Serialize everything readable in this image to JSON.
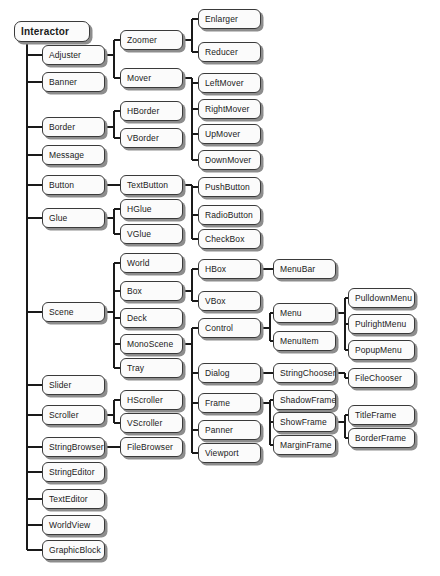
{
  "diagram": {
    "type": "class-hierarchy-tree",
    "orientation": "left-to-right",
    "style": {
      "node_fill": "#fbfbfb",
      "node_border": "#3a3a3a",
      "node_shadow": "#8d8d8d",
      "connector": "#1a1a1a",
      "background": "#ffffff"
    },
    "columns": [
      {
        "index": 1,
        "x": 14,
        "width": 76,
        "nodes": [
          {
            "id": "interactor",
            "label": "Interactor",
            "y": 21,
            "root": true,
            "parent": null
          }
        ]
      },
      {
        "index": 2,
        "x": 42,
        "width": 63,
        "nodes": [
          {
            "id": "adjuster",
            "label": "Adjuster",
            "y": 45,
            "parent": "interactor"
          },
          {
            "id": "banner",
            "label": "Banner",
            "y": 72,
            "parent": "interactor"
          },
          {
            "id": "border",
            "label": "Border",
            "y": 117,
            "parent": "interactor"
          },
          {
            "id": "message",
            "label": "Message",
            "y": 145,
            "parent": "interactor"
          },
          {
            "id": "button",
            "label": "Button",
            "y": 175,
            "parent": "interactor"
          },
          {
            "id": "glue",
            "label": "Glue",
            "y": 208,
            "parent": "interactor"
          },
          {
            "id": "scene",
            "label": "Scene",
            "y": 302,
            "parent": "interactor"
          },
          {
            "id": "slider",
            "label": "Slider",
            "y": 375,
            "parent": "interactor"
          },
          {
            "id": "scroller",
            "label": "Scroller",
            "y": 405,
            "parent": "interactor"
          },
          {
            "id": "stringbrowser",
            "label": "StringBrowser",
            "y": 437,
            "parent": "interactor"
          },
          {
            "id": "stringeditor",
            "label": "StringEditor",
            "y": 462,
            "parent": "interactor"
          },
          {
            "id": "texteditor",
            "label": "TextEditor",
            "y": 489,
            "parent": "interactor"
          },
          {
            "id": "worldview",
            "label": "WorldView",
            "y": 515,
            "parent": "interactor"
          },
          {
            "id": "graphicblock",
            "label": "GraphicBlock",
            "y": 540,
            "parent": "interactor"
          }
        ]
      },
      {
        "index": 3,
        "x": 120,
        "width": 63,
        "nodes": [
          {
            "id": "zoomer",
            "label": "Zoomer",
            "y": 30,
            "parent": "adjuster"
          },
          {
            "id": "mover",
            "label": "Mover",
            "y": 68,
            "parent": "adjuster"
          },
          {
            "id": "hborder",
            "label": "HBorder",
            "y": 101,
            "parent": "border"
          },
          {
            "id": "vborder",
            "label": "VBorder",
            "y": 128,
            "parent": "border"
          },
          {
            "id": "textbutton",
            "label": "TextButton",
            "y": 175,
            "parent": "button"
          },
          {
            "id": "hglue",
            "label": "HGlue",
            "y": 199,
            "parent": "glue"
          },
          {
            "id": "vglue",
            "label": "VGlue",
            "y": 224,
            "parent": "glue"
          },
          {
            "id": "world",
            "label": "World",
            "y": 253,
            "parent": "scene"
          },
          {
            "id": "box",
            "label": "Box",
            "y": 281,
            "parent": "scene"
          },
          {
            "id": "deck",
            "label": "Deck",
            "y": 308,
            "parent": "scene"
          },
          {
            "id": "monoscene",
            "label": "MonoScene",
            "y": 334,
            "parent": "scene"
          },
          {
            "id": "tray",
            "label": "Tray",
            "y": 358,
            "parent": "scene"
          },
          {
            "id": "hscroller",
            "label": "HScroller",
            "y": 390,
            "parent": "scroller"
          },
          {
            "id": "vscroller",
            "label": "VScroller",
            "y": 413,
            "parent": "scroller"
          },
          {
            "id": "filebrowser",
            "label": "FileBrowser",
            "y": 437,
            "parent": "stringbrowser"
          }
        ]
      },
      {
        "index": 4,
        "x": 198,
        "width": 63,
        "nodes": [
          {
            "id": "enlarger",
            "label": "Enlarger",
            "y": 9,
            "parent": "zoomer"
          },
          {
            "id": "reducer",
            "label": "Reducer",
            "y": 42,
            "parent": "zoomer"
          },
          {
            "id": "leftmover",
            "label": "LeftMover",
            "y": 73,
            "parent": "mover"
          },
          {
            "id": "rightmover",
            "label": "RightMover",
            "y": 99,
            "parent": "mover"
          },
          {
            "id": "upmover",
            "label": "UpMover",
            "y": 124,
            "parent": "mover"
          },
          {
            "id": "downmover",
            "label": "DownMover",
            "y": 150,
            "parent": "mover"
          },
          {
            "id": "pushbutton",
            "label": "PushButton",
            "y": 177,
            "parent": "textbutton"
          },
          {
            "id": "radiobutton",
            "label": "RadioButton",
            "y": 205,
            "parent": "textbutton"
          },
          {
            "id": "checkbox",
            "label": "CheckBox",
            "y": 229,
            "parent": "textbutton"
          },
          {
            "id": "hbox",
            "label": "HBox",
            "y": 259,
            "parent": "box"
          },
          {
            "id": "vbox",
            "label": "VBox",
            "y": 291,
            "parent": "box"
          },
          {
            "id": "control",
            "label": "Control",
            "y": 318,
            "parent": "monoscene"
          },
          {
            "id": "dialog",
            "label": "Dialog",
            "y": 363,
            "parent": "monoscene"
          },
          {
            "id": "frame",
            "label": "Frame",
            "y": 393,
            "parent": "monoscene"
          },
          {
            "id": "panner",
            "label": "Panner",
            "y": 420,
            "parent": "monoscene"
          },
          {
            "id": "viewport",
            "label": "Viewport",
            "y": 443,
            "parent": "monoscene"
          }
        ]
      },
      {
        "index": 5,
        "x": 273,
        "width": 63,
        "nodes": [
          {
            "id": "menubar",
            "label": "MenuBar",
            "y": 259,
            "parent": "hbox"
          },
          {
            "id": "menu",
            "label": "Menu",
            "y": 303,
            "parent": "control"
          },
          {
            "id": "menuitem",
            "label": "MenuItem",
            "y": 331,
            "parent": "control"
          },
          {
            "id": "stringchooser",
            "label": "StringChooser",
            "y": 363,
            "parent": "dialog"
          },
          {
            "id": "shadowframe",
            "label": "ShadowFrame",
            "y": 390,
            "parent": "frame"
          },
          {
            "id": "showframe",
            "label": "ShowFrame",
            "y": 412,
            "parent": "frame"
          },
          {
            "id": "marginframe",
            "label": "MarginFrame",
            "y": 435,
            "parent": "frame"
          }
        ]
      },
      {
        "index": 6,
        "x": 348,
        "width": 67,
        "nodes": [
          {
            "id": "pulldownmenu",
            "label": "PulldownMenu",
            "y": 288,
            "parent": "menu"
          },
          {
            "id": "pulrightmenu",
            "label": "PulrightMenu",
            "y": 314,
            "parent": "menu"
          },
          {
            "id": "popupmenu",
            "label": "PopupMenu",
            "y": 340,
            "parent": "menu"
          },
          {
            "id": "filechooser",
            "label": "FileChooser",
            "y": 368,
            "parent": "stringchooser"
          },
          {
            "id": "titleframe",
            "label": "TitleFrame",
            "y": 405,
            "parent": "showframe"
          },
          {
            "id": "borderframe",
            "label": "BorderFrame",
            "y": 428,
            "parent": "showframe"
          }
        ]
      }
    ]
  }
}
